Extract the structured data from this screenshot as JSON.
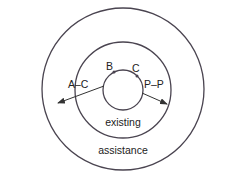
{
  "diagram": {
    "type": "concentric-circles",
    "colors": {
      "stroke": "#4a4450",
      "text": "#222222",
      "background": "#ffffff"
    },
    "circles": [
      {
        "id": "outer",
        "label": "assistance"
      },
      {
        "id": "middle",
        "label": "existing"
      },
      {
        "id": "inner",
        "label": ""
      }
    ],
    "points": [
      {
        "id": "B",
        "label": "B"
      },
      {
        "id": "C",
        "label": "C"
      }
    ],
    "arrows": [
      {
        "id": "left-arrow",
        "label": "A–C"
      },
      {
        "id": "right-arrow",
        "label": "P–P"
      }
    ]
  }
}
